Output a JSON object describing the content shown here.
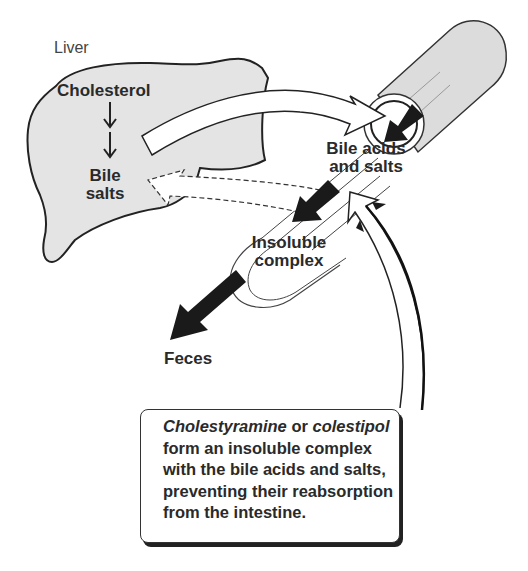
{
  "diagram": {
    "labels": {
      "liver": "Liver",
      "cholesterol": "Cholesterol",
      "bile_salts_line1": "Bile",
      "bile_salts_line2": "salts",
      "bile_acids_line1": "Bile acids",
      "bile_acids_line2": "and salts",
      "insoluble_line1": "Insoluble",
      "insoluble_line2": "complex",
      "feces": "Feces"
    },
    "callout": {
      "drug1": "Cholestyramine",
      "or": " or ",
      "drug2": "colestipol",
      "line2": "form an insoluble complex",
      "line3": "with the bile acids and salts,",
      "line4": "preventing their reabsorption",
      "line5": "from the intestine."
    },
    "colors": {
      "liver_fill": "#e4e4e4",
      "intestine_fill": "#dcdcdc",
      "outline": "#222222",
      "arrow_black": "#1a1a1a"
    }
  }
}
